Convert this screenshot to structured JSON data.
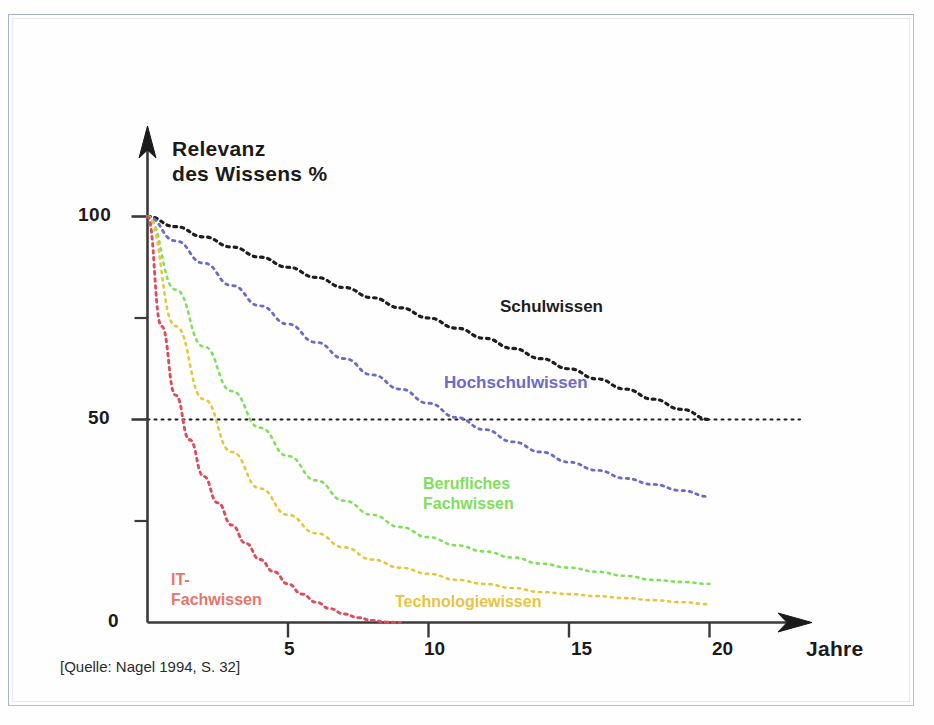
{
  "figure": {
    "source_note": "[Quelle: Nagel 1994, S. 32]",
    "y_axis_title_line1": "Relevanz",
    "y_axis_title_line2": "des Wissens %",
    "x_axis_title": "Jahre"
  },
  "chart_data": {
    "type": "line",
    "title": "",
    "subtitle": "",
    "xlabel": "Jahre",
    "ylabel": "Relevanz des Wissens %",
    "xlim": [
      0,
      21
    ],
    "ylim": [
      0,
      110
    ],
    "x_ticks": [
      5,
      10,
      15,
      20
    ],
    "x_tick_labels": [
      "5",
      "10",
      "15",
      "20"
    ],
    "y_ticks": [
      0,
      25,
      50,
      75,
      100
    ],
    "y_tick_labels": [
      "0",
      "",
      "50",
      "",
      "100"
    ],
    "grid": false,
    "legend_position": "inline-annotations",
    "annotations": [
      {
        "text": "Schulwissen",
        "x": 12.0,
        "y": 73,
        "color": "#1e1e1e"
      },
      {
        "text": "Hochschulwissen",
        "x": 10.2,
        "y": 55,
        "color": "#6b6bc8"
      },
      {
        "text": "Berufliches",
        "x": 9.5,
        "y": 31,
        "color": "#7fe05a"
      },
      {
        "text": "Fachwissen",
        "x": 9.5,
        "y": 26,
        "color": "#7fe05a"
      },
      {
        "text": "Technologiewissen",
        "x": 8.5,
        "y": 5,
        "color": "#e8c53c"
      },
      {
        "text": "IT-",
        "x": 0.8,
        "y": 11,
        "color": "#e8756b"
      },
      {
        "text": "Fachwissen",
        "x": 0.8,
        "y": 6,
        "color": "#e8756b"
      }
    ],
    "reference_line": {
      "y": 50,
      "style": "dotted",
      "color": "#1e1e1e"
    },
    "series": [
      {
        "name": "Schulwissen",
        "label": "Schulwissen",
        "color": "#1e1e1e",
        "style": "dotted",
        "x": [
          0,
          1,
          2,
          3,
          4,
          5,
          6,
          7,
          8,
          9,
          10,
          11,
          12,
          13,
          14,
          15,
          16,
          17,
          18,
          19,
          20
        ],
        "values": [
          100,
          97.5,
          95,
          92.5,
          90,
          87.5,
          85,
          82.5,
          80,
          77.5,
          75,
          72.5,
          70,
          67.5,
          65,
          62.5,
          60,
          57.5,
          55,
          52.5,
          50
        ]
      },
      {
        "name": "Hochschulwissen",
        "label": "Hochschulwissen",
        "color": "#6b6bc8",
        "style": "dotted",
        "x": [
          0,
          1,
          2,
          3,
          4,
          5,
          6,
          7,
          8,
          9,
          10,
          11,
          12,
          13,
          14,
          15,
          16,
          17,
          18,
          19,
          20
        ],
        "values": [
          100,
          94,
          88.5,
          83,
          78,
          73.5,
          69,
          65,
          61,
          57.5,
          54,
          50.5,
          47.5,
          44.5,
          42,
          39.5,
          37.5,
          35.5,
          34,
          32.5,
          31
        ]
      },
      {
        "name": "Berufliches Fachwissen",
        "label": "Berufliches Fachwissen",
        "color": "#7fe05a",
        "style": "dotted",
        "x": [
          0,
          1,
          2,
          3,
          4,
          5,
          6,
          7,
          8,
          9,
          10,
          11,
          12,
          13,
          14,
          15,
          16,
          17,
          18,
          19,
          20
        ],
        "values": [
          100,
          82,
          68,
          57,
          48,
          41,
          35,
          30,
          26.5,
          23.5,
          21,
          19,
          17.5,
          16,
          14.5,
          13.5,
          12.5,
          11.5,
          10.5,
          10,
          9.5
        ]
      },
      {
        "name": "Technologiewissen",
        "label": "Technologiewissen",
        "color": "#e8c53c",
        "style": "dotted",
        "x": [
          0,
          1,
          2,
          3,
          4,
          5,
          6,
          7,
          8,
          9,
          10,
          11,
          12,
          13,
          14,
          15,
          16,
          17,
          18,
          19,
          20
        ],
        "values": [
          100,
          73,
          55,
          42,
          33,
          26.5,
          22,
          18.5,
          15.5,
          13.5,
          12,
          10.5,
          9.5,
          8.5,
          7.5,
          7,
          6.5,
          6,
          5.5,
          5,
          4.5
        ]
      },
      {
        "name": "IT-Fachwissen",
        "label": "IT-Fachwissen",
        "color": "#d94f5c",
        "style": "dotted",
        "x": [
          0,
          0.5,
          1,
          1.5,
          2,
          2.5,
          3,
          3.5,
          4,
          4.5,
          5,
          5.5,
          6,
          6.5,
          7,
          7.5,
          8,
          8.5,
          9
        ],
        "values": [
          100,
          73,
          56,
          45,
          36,
          29.5,
          24,
          19.5,
          15.5,
          12.5,
          9.5,
          7,
          5,
          3.4,
          2.1,
          1.2,
          0.5,
          0.1,
          0
        ]
      }
    ]
  }
}
